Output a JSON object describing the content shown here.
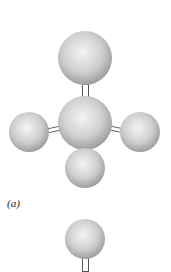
{
  "figure": {
    "panel_a": {
      "label": "(a)",
      "atoms": [
        {
          "name": "top-atom",
          "cx": 85,
          "cy": 58,
          "r": 27
        },
        {
          "name": "center-atom",
          "cx": 85,
          "cy": 123,
          "r": 27
        },
        {
          "name": "left-atom",
          "cx": 29,
          "cy": 132,
          "r": 20
        },
        {
          "name": "right-atom",
          "cx": 140,
          "cy": 132,
          "r": 20
        },
        {
          "name": "bottom-atom",
          "cx": 85,
          "cy": 168,
          "r": 20
        }
      ]
    },
    "panel_b": {
      "atoms": [
        {
          "name": "single-atom",
          "cx": 85,
          "cy": 239,
          "r": 20
        }
      ]
    }
  }
}
